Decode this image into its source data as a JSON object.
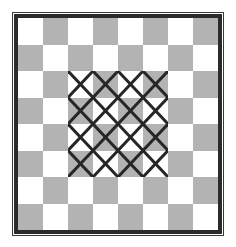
{
  "figure": {
    "canvas": {
      "width": 236,
      "height": 247,
      "background": "#ffffff"
    }
  },
  "frame": {
    "outer_line_color": "#3a3a3a",
    "inner_border_color": "#2b2b2b",
    "outer_line_width": 1,
    "inner_border_width": 4
  },
  "chart_data": {
    "type": "heatmap",
    "xlabel": "",
    "ylabel": "",
    "rows": 8,
    "cols": 8,
    "colors": {
      "light": "#ffffff",
      "dark": "#b3b3b3",
      "mark": "#262626"
    },
    "grid": [
      [
        "light",
        "dark",
        "light",
        "dark",
        "light",
        "dark",
        "light",
        "dark"
      ],
      [
        "dark",
        "light",
        "dark",
        "light",
        "dark",
        "light",
        "dark",
        "light"
      ],
      [
        "light",
        "dark",
        "light",
        "dark",
        "light",
        "dark",
        "light",
        "dark"
      ],
      [
        "dark",
        "light",
        "dark",
        "light",
        "dark",
        "light",
        "dark",
        "light"
      ],
      [
        "light",
        "dark",
        "light",
        "dark",
        "light",
        "dark",
        "light",
        "dark"
      ],
      [
        "dark",
        "light",
        "dark",
        "light",
        "dark",
        "light",
        "dark",
        "light"
      ],
      [
        "light",
        "dark",
        "light",
        "dark",
        "light",
        "dark",
        "light",
        "dark"
      ],
      [
        "dark",
        "light",
        "dark",
        "light",
        "dark",
        "light",
        "dark",
        "light"
      ]
    ],
    "marked_region": {
      "shape": "x-cross",
      "row_start": 2,
      "row_end": 5,
      "col_start": 2,
      "col_end": 5,
      "rows": 4,
      "cols": 4,
      "count": 16,
      "line_color": "#262626",
      "line_width": 3
    },
    "legend": []
  }
}
